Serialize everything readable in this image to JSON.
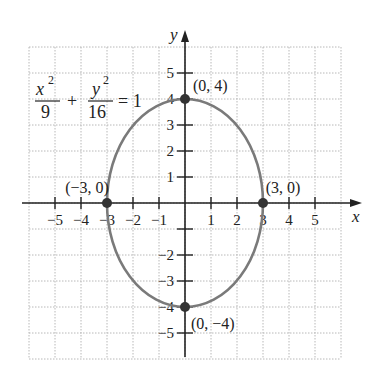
{
  "chart_data": {
    "type": "line",
    "title": "",
    "equation": {
      "x_num": "x",
      "x_exp": "2",
      "x_den": "9",
      "y_num": "y",
      "y_exp": "2",
      "y_den": "16",
      "plus": "+",
      "rhs": "= 1"
    },
    "xlabel": "x",
    "ylabel": "y",
    "xlim": [
      -6,
      6
    ],
    "ylim": [
      -6,
      6
    ],
    "grid": true,
    "x_ticks": [
      -5,
      -4,
      -3,
      -2,
      -1,
      1,
      2,
      3,
      4,
      5
    ],
    "y_ticks": [
      -5,
      -4,
      -3,
      -2,
      -1,
      1,
      2,
      3,
      4,
      5
    ],
    "x_tick_labels": [
      "−5",
      "−4",
      "−3",
      "−2",
      "−1",
      "1",
      "2",
      "3",
      "4",
      "5"
    ],
    "y_tick_labels": [
      "5",
      "4",
      "3",
      "2",
      "1",
      "−2",
      "−3",
      "−4",
      "−5"
    ],
    "series": [
      {
        "name": "ellipse",
        "shape": "ellipse",
        "center": [
          0,
          0
        ],
        "a": 3,
        "b": 4,
        "color": "#7a7a7a"
      }
    ],
    "points": [
      {
        "x": 0,
        "y": 4,
        "label": "(0, 4)"
      },
      {
        "x": 0,
        "y": -4,
        "label": "(0, −4)"
      },
      {
        "x": -3,
        "y": 0,
        "label": "(−3, 0)"
      },
      {
        "x": 3,
        "y": 0,
        "label": "(3, 0)"
      }
    ]
  },
  "colors": {
    "grid": "#b8b8b8",
    "axis": "#222222",
    "curve": "#7a7a7a",
    "point": "#333333"
  }
}
